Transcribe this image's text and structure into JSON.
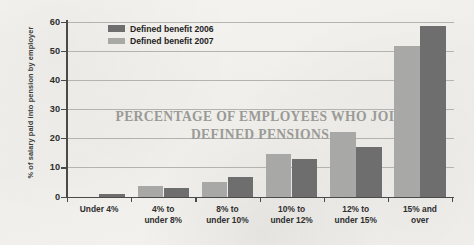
{
  "chart_data": {
    "type": "bar",
    "title": "PERCENTAGE OF EMPLOYEES WHO JOIN DEFINED PENSIONS",
    "title_line1": "PERCENTAGE OF EMPLOYEES WHO JOIN",
    "title_line2": "DEFINED PENSIONS",
    "xlabel": "",
    "ylabel": "% of salary paid into pension by employer",
    "ylim": [
      0,
      60
    ],
    "ytick_labels": [
      "60",
      "50",
      "40",
      "30",
      "20",
      "10",
      "0"
    ],
    "ytick_values": [
      60,
      50,
      40,
      30,
      20,
      10,
      0
    ],
    "grid": true,
    "legend_position": "top-left-inside",
    "categories": [
      "Under 4%",
      "4% to under 8%",
      "8% to under 10%",
      "10% to under 12%",
      "12% to under 15%",
      "15% and over"
    ],
    "category_labels": [
      {
        "line1": "Under 4%",
        "line2": ""
      },
      {
        "line1": "4% to",
        "line2": "under 8%"
      },
      {
        "line1": "8% to",
        "line2": "under 10%"
      },
      {
        "line1": "10% to",
        "line2": "under 12%"
      },
      {
        "line1": "12% to",
        "line2": "under 15%"
      },
      {
        "line1": "15% and",
        "line2": "over"
      }
    ],
    "series": [
      {
        "name": "Defined benefit 2007",
        "color": "#a8a8a6",
        "values": [
          0,
          3.5,
          5.0,
          14.5,
          22.0,
          51.5
        ]
      },
      {
        "name": "Defined benefit 2006",
        "color": "#6e6e6e",
        "values": [
          0.7,
          3.0,
          6.7,
          13.0,
          17.0,
          58.5
        ]
      }
    ]
  },
  "legend": {
    "items": [
      {
        "label": "Defined benefit 2006",
        "color": "#6e6e6e"
      },
      {
        "label": "Defined benefit 2007",
        "color": "#a8a8a6"
      }
    ]
  },
  "colors": {
    "series_2006": "#6e6e6e",
    "series_2007": "#a8a8a6",
    "axis": "#4a4a4a",
    "gridline": "#a9a9a5",
    "watermark_title": "#9a9a96",
    "background": "#f3f2ef"
  }
}
